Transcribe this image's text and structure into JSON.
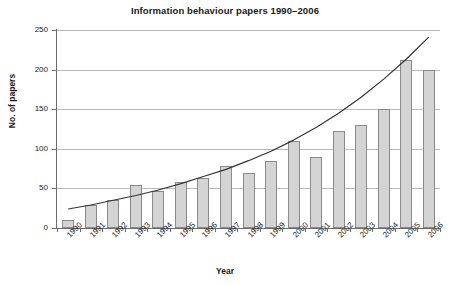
{
  "chart_data": {
    "type": "bar",
    "title": "Information behaviour papers 1990–2006",
    "xlabel": "Year",
    "ylabel": "No. of papers",
    "categories": [
      "1990",
      "1991",
      "1992",
      "1993",
      "1994",
      "1995",
      "1996",
      "1997",
      "1998",
      "1999",
      "2000",
      "2001",
      "2002",
      "2003",
      "2004",
      "2005",
      "2006"
    ],
    "values": [
      10,
      29,
      35,
      54,
      47,
      58,
      63,
      78,
      70,
      85,
      110,
      90,
      122,
      130,
      150,
      212,
      200
    ],
    "ylim": [
      0,
      250
    ],
    "yticks": [
      0,
      50,
      100,
      150,
      200,
      250
    ],
    "ytick_labels": [
      "0",
      "50",
      "100",
      "150",
      "200",
      "250"
    ],
    "grid": true,
    "legend": "none",
    "series": [
      {
        "name": "No. of papers",
        "type": "bar",
        "values": [
          10,
          29,
          35,
          54,
          47,
          58,
          63,
          78,
          70,
          85,
          110,
          90,
          122,
          130,
          150,
          212,
          200
        ]
      },
      {
        "name": "trend curve",
        "type": "line",
        "values": [
          24,
          29,
          35,
          41,
          48,
          56,
          65,
          74,
          85,
          97,
          111,
          127,
          145,
          165,
          188,
          213,
          241
        ]
      }
    ],
    "colors": {
      "bar_fill": "#d4d4d4",
      "bar_border": "#8a8a8a",
      "trend_line": "#333333",
      "grid": "#b9b9b9",
      "axis": "#6b6b6b",
      "text": "#1a1a1a",
      "background": "#ffffff"
    }
  }
}
